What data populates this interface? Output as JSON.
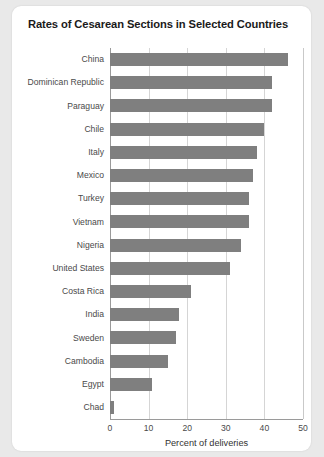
{
  "chart_data": {
    "type": "bar",
    "orientation": "horizontal",
    "title": "Rates of Cesarean Sections in Selected Countries",
    "xlabel": "Percent of deliveries",
    "ylabel": "",
    "xlim": [
      0,
      50
    ],
    "xticks": [
      0,
      10,
      20,
      30,
      40,
      50
    ],
    "grid": true,
    "legend": null,
    "bar_color": "#7f7f7f",
    "categories": [
      "China",
      "Dominican Republic",
      "Paraguay",
      "Chile",
      "Italy",
      "Mexico",
      "Turkey",
      "Vietnam",
      "Nigeria",
      "United States",
      "Costa Rica",
      "India",
      "Sweden",
      "Cambodia",
      "Egypt",
      "Chad"
    ],
    "values": [
      46,
      42,
      42,
      40,
      38,
      37,
      36,
      36,
      34,
      31,
      21,
      18,
      17,
      15,
      11,
      1
    ]
  },
  "card": {
    "background": "#ffffff",
    "page_background": "#e9e9e9"
  }
}
